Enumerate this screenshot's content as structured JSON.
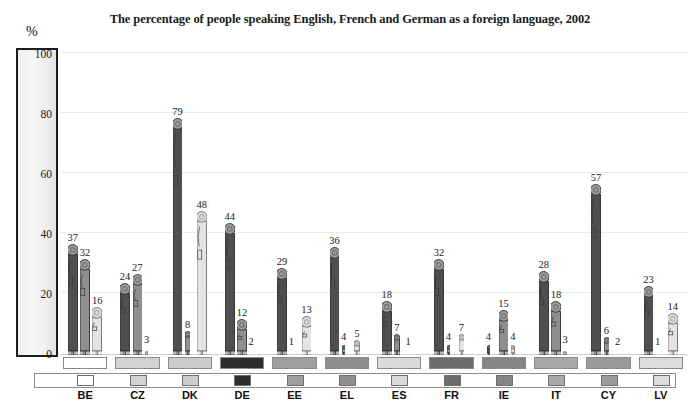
{
  "chart_data": {
    "type": "bar",
    "title": "The percentage of people speaking English, French and German as a foreign language, 2002",
    "xlabel": "",
    "ylabel": "%",
    "ylim": [
      0,
      100
    ],
    "yticks": [
      0,
      20,
      40,
      60,
      80,
      100
    ],
    "grid": true,
    "legend": "none",
    "categories": [
      "BE",
      "CZ",
      "DK",
      "DE",
      "EE",
      "EL",
      "ES",
      "FR",
      "IE",
      "IT",
      "CY",
      "LV"
    ],
    "series": [
      {
        "name": "English",
        "color": "#4f4f4f",
        "values": [
          37,
          24,
          79,
          44,
          29,
          36,
          18,
          32,
          4,
          28,
          57,
          23
        ]
      },
      {
        "name": "French",
        "color": "#8f8f8f",
        "values": [
          32,
          27,
          8,
          12,
          1,
          4,
          7,
          4,
          15,
          18,
          6,
          1
        ]
      },
      {
        "name": "German",
        "color": "#e4e4e4",
        "values": [
          16,
          3,
          48,
          2,
          13,
          5,
          1,
          7,
          4,
          3,
          2,
          14
        ]
      }
    ],
    "country_band_colors": [
      "#ffffff",
      "#d2d2d2",
      "#cccccc",
      "#2e2e2e",
      "#9e9e9e",
      "#8e8e8e",
      "#dadada",
      "#6d6d6d",
      "#858585",
      "#a8a8a8",
      "#9a9a9a",
      "#dcdcdc"
    ]
  },
  "axis": {
    "unit_label": "%",
    "tick_labels": [
      "100",
      "80",
      "60",
      "40",
      "20",
      "0"
    ]
  }
}
